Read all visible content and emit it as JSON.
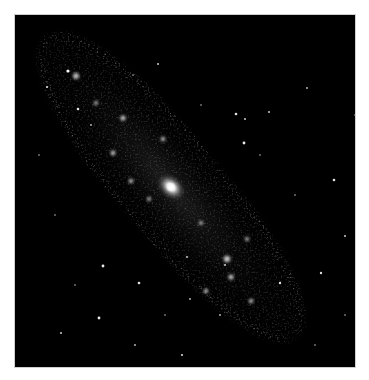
{
  "image": {
    "subject": "Spiral galaxy (Andromeda-like) viewed at an angle, grayscale",
    "background_color": "#000000",
    "border_color": "#ffffff",
    "core": {
      "cx": 170,
      "cy": 186,
      "color": "#ffffff"
    },
    "galaxy_angle_deg": 50,
    "stars": [
      [
        53,
        56,
        1.6
      ],
      [
        32,
        72,
        1.1
      ],
      [
        63,
        94,
        1.3
      ],
      [
        143,
        49,
        1.0
      ],
      [
        221,
        99,
        1.3
      ],
      [
        230,
        104,
        1.0
      ],
      [
        254,
        97,
        1.0
      ],
      [
        229,
        128,
        1.4
      ],
      [
        319,
        165,
        1.3
      ],
      [
        330,
        221,
        1.0
      ],
      [
        306,
        258,
        1.2
      ],
      [
        88,
        251,
        1.4
      ],
      [
        124,
        268,
        1.3
      ],
      [
        84,
        303,
        1.4
      ],
      [
        46,
        318,
        1.0
      ],
      [
        167,
        340,
        1.1
      ],
      [
        190,
        355,
        1.0
      ],
      [
        265,
        268,
        1.2
      ],
      [
        172,
        242,
        1.0
      ],
      [
        175,
        284,
        0.9
      ],
      [
        292,
        73,
        0.9
      ],
      [
        186,
        90,
        0.8
      ],
      [
        40,
        200,
        0.8
      ],
      [
        210,
        250,
        1.0
      ],
      [
        76,
        110,
        0.9
      ],
      [
        118,
        60,
        0.8
      ],
      [
        300,
        330,
        0.8
      ],
      [
        340,
        100,
        0.8
      ],
      [
        24,
        140,
        0.8
      ],
      [
        150,
        300,
        0.8
      ],
      [
        280,
        180,
        0.8
      ],
      [
        120,
        330,
        0.9
      ],
      [
        60,
        270,
        0.8
      ],
      [
        330,
        300,
        0.8
      ],
      [
        205,
        300,
        0.9
      ],
      [
        245,
        140,
        0.8
      ]
    ]
  }
}
